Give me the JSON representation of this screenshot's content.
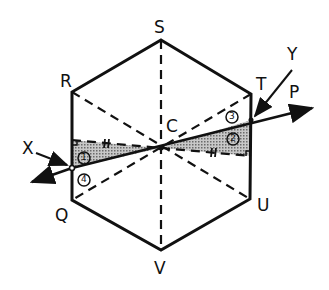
{
  "diagram": {
    "type": "geometry",
    "shape": "regular hexagon QRSTUV with center C",
    "colors": {
      "ink": "#111111",
      "shade": "#9a9a9a",
      "background": "#ffffff"
    },
    "vertices": {
      "S": {
        "label": "S",
        "x": 161,
        "y": 40
      },
      "R": {
        "label": "R",
        "x": 72,
        "y": 92
      },
      "T": {
        "label": "T",
        "x": 251,
        "y": 94
      },
      "Q": {
        "label": "Q",
        "x": 72,
        "y": 200
      },
      "U": {
        "label": "U",
        "x": 250,
        "y": 199
      },
      "V": {
        "label": "V",
        "x": 161,
        "y": 250
      },
      "C": {
        "label": "C",
        "x": 161,
        "y": 148
      }
    },
    "line_labels": {
      "X": {
        "label": "X"
      },
      "Y": {
        "label": "Y"
      },
      "P": {
        "label": "P"
      }
    },
    "region_labels": [
      "1",
      "2",
      "3",
      "4"
    ],
    "tick_marks": "double tick (#) on each dashed horizontal segment from C",
    "dashed_diagonals": [
      "SV",
      "RU",
      "TQ"
    ]
  }
}
